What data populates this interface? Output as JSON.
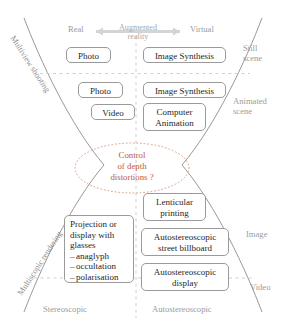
{
  "diagram": {
    "title_hub": {
      "line1": "Control",
      "line2": "of depth",
      "line3": "distortions ?"
    },
    "axes": {
      "top_left": "Real",
      "top_right": "Virtual",
      "top_center_line1": "Augmented",
      "top_center_line2": "reality",
      "right_top_line1": "Still",
      "right_top_line2": "scene",
      "right_second_line1": "Animated",
      "right_second_line2": "scene",
      "right_third": "Image",
      "right_fourth": "Video",
      "bottom_left": "Stereoscopic",
      "bottom_right": "Autostereoscopic",
      "left_upper_rotated": "Multiview shooting",
      "left_lower_rotated": "Multiscopic rendering"
    },
    "nodes": {
      "q1_left": "Photo",
      "q1_right": "Image Synthesis",
      "q2_left_a": "Photo",
      "q2_left_b": "Video",
      "q2_right_a": "Image Synthesis",
      "q2_right_b_line1": "Computer",
      "q2_right_b_line2": "Animation",
      "q3_left_head_line1": "Projection or",
      "q3_left_head_line2": "display with",
      "q3_left_head_line3": "glasses",
      "q3_left_items": [
        "anaglyph",
        "occultation",
        "polarisation"
      ],
      "q3_right_a_line1": "Lenticular",
      "q3_right_a_line2": "printing",
      "q3_right_b_line1": "Autostereoscopic",
      "q3_right_b_line2": "street billboard",
      "q4_right_line1": "Autostereoscopic",
      "q4_right_line2": "display"
    },
    "colors": {
      "hub_text": "#c4593c",
      "hub_border": "#e0a08c",
      "axis_text": "#9b9b9b",
      "node_border": "#9a9a9a",
      "curve": "#8c8c8c",
      "dashed": "#c9c9c9",
      "arrow": "#cfcfcf"
    }
  }
}
